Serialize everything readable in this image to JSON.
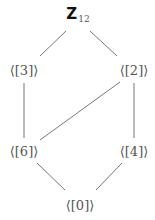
{
  "diagram": {
    "type": "subgroup-lattice",
    "top": {
      "symbol": "Z",
      "subscript": "12"
    },
    "nodes": [
      {
        "id": "Z12",
        "label": "Z12",
        "x": 78,
        "y": 15
      },
      {
        "id": "3",
        "label": "⟨[3]⟩",
        "x": 24,
        "y": 70
      },
      {
        "id": "2",
        "label": "⟨[2]⟩",
        "x": 134,
        "y": 70
      },
      {
        "id": "6",
        "label": "⟨[6]⟩",
        "x": 24,
        "y": 151
      },
      {
        "id": "4",
        "label": "⟨[4]⟩",
        "x": 134,
        "y": 151
      },
      {
        "id": "0",
        "label": "⟨[0]⟩",
        "x": 80,
        "y": 205
      }
    ],
    "edges": [
      {
        "from": "Z12",
        "to": "3"
      },
      {
        "from": "Z12",
        "to": "2"
      },
      {
        "from": "3",
        "to": "6"
      },
      {
        "from": "2",
        "to": "6"
      },
      {
        "from": "2",
        "to": "4"
      },
      {
        "from": "6",
        "to": "0"
      },
      {
        "from": "4",
        "to": "0"
      }
    ],
    "colors": {
      "edge": "#777777",
      "label": "#555555",
      "top_label": "#111111"
    }
  }
}
